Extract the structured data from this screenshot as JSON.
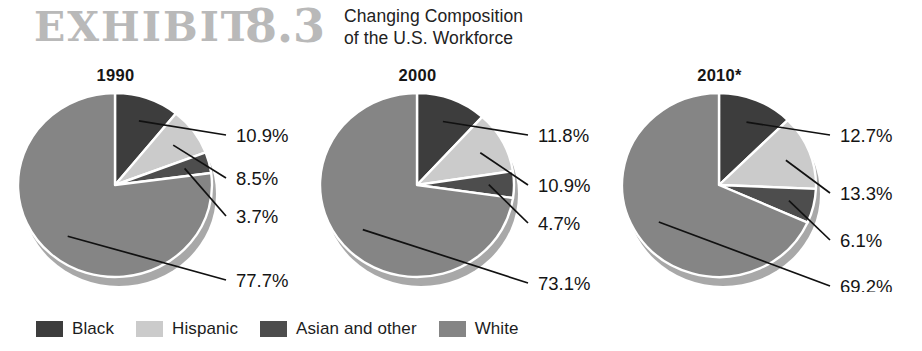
{
  "header": {
    "exhibit_label": "EXHIBIT",
    "exhibit_number": "8.3",
    "title_line1": "Changing Composition",
    "title_line2": "of the U.S. Workforce",
    "exhibit_color": "#b9b9b9"
  },
  "legend": {
    "items": [
      {
        "label": "Black",
        "color": "#3d3d3d"
      },
      {
        "label": "Hispanic",
        "color": "#cbcbcb"
      },
      {
        "label": "Asian and other",
        "color": "#4d4d4d"
      },
      {
        "label": "White",
        "color": "#858585"
      }
    ]
  },
  "chart_data": {
    "type": "pie",
    "title": "Changing Composition of the U.S. Workforce",
    "legend_position": "bottom",
    "categories": [
      "Black",
      "Hispanic",
      "Asian and other",
      "White"
    ],
    "colors": [
      "#3d3d3d",
      "#cbcbcb",
      "#4d4d4d",
      "#858585"
    ],
    "unit": "%",
    "note": "* 2010 figures are projections",
    "charts": [
      {
        "title": "1990",
        "values": [
          10.9,
          8.5,
          3.7,
          77.7
        ],
        "labels": [
          "10.9%",
          "8.5%",
          "3.7%",
          "77.7%"
        ]
      },
      {
        "title": "2000",
        "values": [
          11.8,
          10.9,
          4.7,
          73.1
        ],
        "labels": [
          "11.8%",
          "10.9%",
          "4.7%",
          "73.1%"
        ]
      },
      {
        "title": "2010*",
        "values": [
          12.7,
          13.3,
          6.1,
          69.2
        ],
        "labels": [
          "12.7%",
          "13.3%",
          "6.1%",
          "69.2%"
        ]
      }
    ]
  },
  "geometry": {
    "pie_cx": 107,
    "pie_cy": 97,
    "pie_rx": 97,
    "pie_ry": 92,
    "depth": 9,
    "label_x": 228,
    "leader_start_gap": 4,
    "label_y": [
      [
        47,
        90,
        128,
        192
      ],
      [
        47,
        97,
        135,
        195
      ],
      [
        47,
        105,
        152,
        198
      ]
    ]
  }
}
